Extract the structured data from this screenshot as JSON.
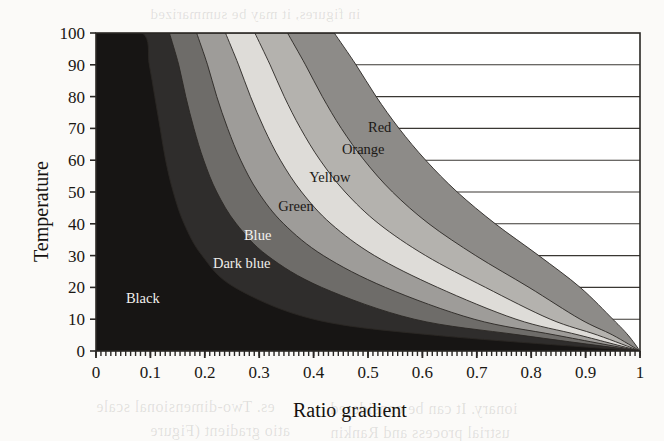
{
  "chart_data": {
    "type": "area",
    "title": "",
    "xlabel": "Ratio gradient",
    "ylabel": "Temperature",
    "xlim": [
      0,
      1
    ],
    "ylim": [
      0,
      100
    ],
    "xticks": [
      "0",
      "0.1",
      "0.2",
      "0.3",
      "0.4",
      "0.5",
      "0.6",
      "0.7",
      "0.8",
      "0.9",
      "1"
    ],
    "xtick_values": [
      0,
      0.1,
      0.2,
      0.3,
      0.4,
      0.5,
      0.6,
      0.7,
      0.8,
      0.9,
      1
    ],
    "yticks": [
      "0",
      "10",
      "20",
      "30",
      "40",
      "50",
      "60",
      "70",
      "80",
      "90",
      "100"
    ],
    "ytick_values": [
      0,
      10,
      20,
      30,
      40,
      50,
      60,
      70,
      80,
      90,
      100
    ],
    "grid": "horizontal",
    "grid_color": "#3a3733",
    "plot_background": "#ffffff",
    "regions": [
      {
        "name": "Black",
        "label": "Black",
        "color": "#171514",
        "label_color": "#f2f0ec",
        "label_x": 0.055,
        "label_y": 15,
        "boundary_points": [
          [
            0.0,
            100
          ],
          [
            0.085,
            100
          ],
          [
            0.098,
            90
          ],
          [
            0.108,
            80
          ],
          [
            0.118,
            70
          ],
          [
            0.128,
            60
          ],
          [
            0.142,
            50
          ],
          [
            0.162,
            40
          ],
          [
            0.195,
            30
          ],
          [
            0.255,
            20
          ],
          [
            0.4,
            10
          ],
          [
            0.62,
            5
          ],
          [
            1.0,
            0
          ]
        ]
      },
      {
        "name": "Dark blue",
        "label": "Dark blue",
        "color": "#2f2d2c",
        "label_color": "#efedea",
        "label_x": 0.215,
        "label_y": 26,
        "boundary_points": [
          [
            0.135,
            100
          ],
          [
            0.152,
            90
          ],
          [
            0.165,
            80
          ],
          [
            0.18,
            70
          ],
          [
            0.198,
            60
          ],
          [
            0.222,
            50
          ],
          [
            0.258,
            40
          ],
          [
            0.315,
            30
          ],
          [
            0.415,
            20
          ],
          [
            0.585,
            10
          ],
          [
            0.78,
            5
          ],
          [
            1.0,
            0
          ]
        ]
      },
      {
        "name": "Blue",
        "label": "Blue",
        "color": "#6e6c69",
        "label_color": "#f4f2ef",
        "label_x": 0.272,
        "label_y": 35,
        "boundary_points": [
          [
            0.185,
            100
          ],
          [
            0.205,
            90
          ],
          [
            0.222,
            80
          ],
          [
            0.242,
            70
          ],
          [
            0.266,
            60
          ],
          [
            0.298,
            50
          ],
          [
            0.345,
            40
          ],
          [
            0.418,
            30
          ],
          [
            0.532,
            20
          ],
          [
            0.695,
            10
          ],
          [
            0.845,
            5
          ],
          [
            1.0,
            0
          ]
        ]
      },
      {
        "name": "Green",
        "label": "Green",
        "color": "#9e9c99",
        "label_color": "#1c1916",
        "label_x": 0.335,
        "label_y": 44,
        "boundary_points": [
          [
            0.238,
            100
          ],
          [
            0.262,
            90
          ],
          [
            0.284,
            80
          ],
          [
            0.309,
            70
          ],
          [
            0.339,
            60
          ],
          [
            0.378,
            50
          ],
          [
            0.432,
            40
          ],
          [
            0.512,
            30
          ],
          [
            0.628,
            20
          ],
          [
            0.772,
            10
          ],
          [
            0.888,
            5
          ],
          [
            1.0,
            0
          ]
        ]
      },
      {
        "name": "Yellow",
        "label": "Yellow",
        "color": "#dedcd8",
        "label_color": "#1c1916",
        "label_x": 0.392,
        "label_y": 53,
        "boundary_points": [
          [
            0.292,
            100
          ],
          [
            0.32,
            90
          ],
          [
            0.346,
            80
          ],
          [
            0.376,
            70
          ],
          [
            0.412,
            60
          ],
          [
            0.458,
            50
          ],
          [
            0.52,
            40
          ],
          [
            0.606,
            30
          ],
          [
            0.716,
            20
          ],
          [
            0.835,
            10
          ],
          [
            0.922,
            5
          ],
          [
            1.0,
            0
          ]
        ]
      },
      {
        "name": "Orange",
        "label": "Orange",
        "color": "#b4b2ae",
        "label_color": "#1c1916",
        "label_x": 0.452,
        "label_y": 62,
        "boundary_points": [
          [
            0.352,
            100
          ],
          [
            0.385,
            90
          ],
          [
            0.416,
            80
          ],
          [
            0.451,
            70
          ],
          [
            0.493,
            60
          ],
          [
            0.545,
            50
          ],
          [
            0.612,
            40
          ],
          [
            0.698,
            30
          ],
          [
            0.796,
            20
          ],
          [
            0.89,
            10
          ],
          [
            0.95,
            5
          ],
          [
            1.0,
            0
          ]
        ]
      },
      {
        "name": "Red",
        "label": "Red",
        "color": "#8d8b88",
        "label_color": "#1c1916",
        "label_x": 0.5,
        "label_y": 69,
        "boundary_points": [
          [
            0.438,
            100
          ],
          [
            0.478,
            90
          ],
          [
            0.515,
            80
          ],
          [
            0.557,
            70
          ],
          [
            0.606,
            60
          ],
          [
            0.664,
            50
          ],
          [
            0.734,
            40
          ],
          [
            0.814,
            30
          ],
          [
            0.89,
            20
          ],
          [
            0.95,
            10
          ],
          [
            0.978,
            5
          ],
          [
            1.0,
            0
          ]
        ]
      }
    ]
  },
  "ghost_text": [
    {
      "text": "in figures, it may be summarized",
      "x": 150,
      "y": 6,
      "size": 15
    },
    {
      "text": "the case of a multi",
      "x": 330,
      "y": 84,
      "size": 15
    },
    {
      "text": "temperature and",
      "x": 300,
      "y": 128,
      "size": 15
    },
    {
      "text": "behaviour of the",
      "x": 320,
      "y": 172,
      "size": 15
    },
    {
      "text": "A three-dimensional",
      "x": 340,
      "y": 214,
      "size": 15
    },
    {
      "text": "es. Two-dimensional scale",
      "x": 96,
      "y": 398,
      "size": 16
    },
    {
      "text": "atio gradient (Figure",
      "x": 150,
      "y": 422,
      "size": 16
    },
    {
      "text": "ionary. It can be considered",
      "x": 330,
      "y": 400,
      "size": 16
    },
    {
      "text": "ustrial process and Rankin",
      "x": 330,
      "y": 424,
      "size": 16
    }
  ]
}
